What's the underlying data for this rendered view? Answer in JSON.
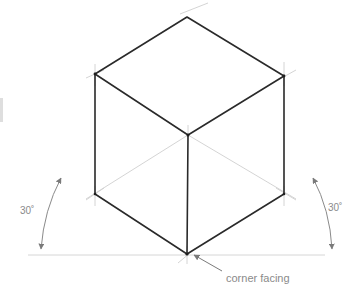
{
  "diagram": {
    "labels": {
      "angle_left": "30˚",
      "angle_right": "30˚",
      "corner_note": "corner facing"
    },
    "colors": {
      "edge": "#2a2a2a",
      "construction": "#c9c9c9",
      "annotation": "#8a8a8a",
      "background": "#ffffff"
    },
    "vertices": {
      "top": [
        187,
        17
      ],
      "left_top": [
        95,
        74
      ],
      "right_top": [
        284,
        76
      ],
      "center": [
        188,
        135
      ],
      "left_bottom": [
        95,
        194
      ],
      "right_bottom": [
        284,
        194
      ],
      "bottom": [
        187,
        254
      ]
    },
    "baseline_y": 255,
    "angle_degrees": 30
  }
}
